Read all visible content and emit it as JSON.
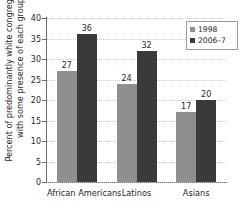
{
  "chart_data": {
    "type": "bar",
    "title": "",
    "xlabel": "",
    "ylabel": "Percent of predominantly white congregations with some presence of each group",
    "ylabel_lines": [
      "Percent of predominantly white congregations",
      "with some presence of each group"
    ],
    "categories": [
      "African Americans",
      "Latinos",
      "Asians"
    ],
    "series": [
      {
        "name": "1998",
        "values": [
          27,
          24,
          17
        ],
        "color": "#8f8f8f"
      },
      {
        "name": "2006–7",
        "values": [
          36,
          32,
          20
        ],
        "color": "#3a3a3a"
      }
    ],
    "ylim": [
      0,
      40
    ],
    "yticks": [
      0,
      5,
      10,
      15,
      20,
      25,
      30,
      35,
      40
    ],
    "ytick_labels": [
      "0",
      "5",
      "10",
      "15",
      "20",
      "25",
      "30",
      "35",
      "40"
    ],
    "grid": true,
    "grid_style": "dotted-horizontal",
    "legend_position": "top-right",
    "value_labels": true
  },
  "legend": {
    "items": [
      {
        "label": "1998",
        "swatch": "legend-swatch-1998"
      },
      {
        "label": "2006–7",
        "swatch": "legend-swatch-2006-7"
      }
    ]
  },
  "colors": {
    "series_1998": "#8f8f8f",
    "series_2006_7": "#3a3a3a",
    "axis": "#6e6e6e",
    "grid": "#c8c8c8",
    "text": "#1f1f1f",
    "background": "#ffffff"
  }
}
